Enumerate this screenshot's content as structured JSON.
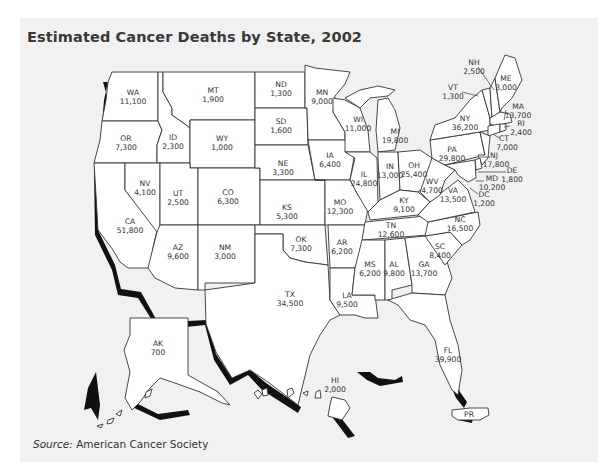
{
  "title": "Estimated Cancer Deaths by State, 2002",
  "source": {
    "prefix": "Source:",
    "text": " American Cancer Society"
  },
  "states": {
    "WA": {
      "abbr": "WA",
      "value": "11,100"
    },
    "OR": {
      "abbr": "OR",
      "value": "7,300"
    },
    "CA": {
      "abbr": "CA",
      "value": "51,800"
    },
    "ID": {
      "abbr": "ID",
      "value": "2,300"
    },
    "NV": {
      "abbr": "NV",
      "value": "4,100"
    },
    "MT": {
      "abbr": "MT",
      "value": "1,900"
    },
    "WY": {
      "abbr": "WY",
      "value": "1,000"
    },
    "UT": {
      "abbr": "UT",
      "value": "2,500"
    },
    "AZ": {
      "abbr": "AZ",
      "value": "9,600"
    },
    "CO": {
      "abbr": "CO",
      "value": "6,300"
    },
    "NM": {
      "abbr": "NM",
      "value": "3,000"
    },
    "ND": {
      "abbr": "ND",
      "value": "1,300"
    },
    "SD": {
      "abbr": "SD",
      "value": "1,600"
    },
    "NE": {
      "abbr": "NE",
      "value": "3,300"
    },
    "KS": {
      "abbr": "KS",
      "value": "5,300"
    },
    "OK": {
      "abbr": "OK",
      "value": "7,300"
    },
    "TX": {
      "abbr": "TX",
      "value": "34,500"
    },
    "MN": {
      "abbr": "MN",
      "value": "9,000"
    },
    "IA": {
      "abbr": "IA",
      "value": "6,400"
    },
    "MO": {
      "abbr": "MO",
      "value": "12,300"
    },
    "AR": {
      "abbr": "AR",
      "value": "6,200"
    },
    "LA": {
      "abbr": "LA",
      "value": "9,500"
    },
    "WI": {
      "abbr": "WI",
      "value": "11,000"
    },
    "IL": {
      "abbr": "IL",
      "value": "24,800"
    },
    "MI": {
      "abbr": "MI",
      "value": "19,800"
    },
    "IN": {
      "abbr": "IN",
      "value": "13,000"
    },
    "OH": {
      "abbr": "OH",
      "value": "25,400"
    },
    "KY": {
      "abbr": "KY",
      "value": "9,100"
    },
    "TN": {
      "abbr": "TN",
      "value": "12,600"
    },
    "MS": {
      "abbr": "MS",
      "value": "6,200"
    },
    "AL": {
      "abbr": "AL",
      "value": "9,800"
    },
    "GA": {
      "abbr": "GA",
      "value": "13,700"
    },
    "FL": {
      "abbr": "FL",
      "value": "39,900"
    },
    "SC": {
      "abbr": "SC",
      "value": "8,400"
    },
    "NC": {
      "abbr": "NC",
      "value": "16,500"
    },
    "VA": {
      "abbr": "VA",
      "value": "13,500"
    },
    "WV": {
      "abbr": "WV",
      "value": "4,700"
    },
    "PA": {
      "abbr": "PA",
      "value": "29,800"
    },
    "NY": {
      "abbr": "NY",
      "value": "36,200"
    },
    "VT": {
      "abbr": "VT",
      "value": "1,300"
    },
    "NH": {
      "abbr": "NH",
      "value": "2,500"
    },
    "ME": {
      "abbr": "ME",
      "value": "3,000"
    },
    "MA": {
      "abbr": "MA",
      "value": "13,700"
    },
    "RI": {
      "abbr": "RI",
      "value": "2,400"
    },
    "CT": {
      "abbr": "CT",
      "value": "7,000"
    },
    "NJ": {
      "abbr": "NJ",
      "value": "17,800"
    },
    "DE": {
      "abbr": "DE",
      "value": "1,800"
    },
    "MD": {
      "abbr": "MD",
      "value": "10,200"
    },
    "DC": {
      "abbr": "DC",
      "value": "1,200"
    },
    "AK": {
      "abbr": "AK",
      "value": "700"
    },
    "HI": {
      "abbr": "HI",
      "value": "2,000"
    },
    "PR": {
      "abbr": "PR"
    }
  },
  "colors": {
    "background_panel": "#f1f1f1",
    "state_fill": "#ffffff",
    "border": "#333333",
    "shadow": "#111111",
    "title": "#3a3a3a"
  }
}
